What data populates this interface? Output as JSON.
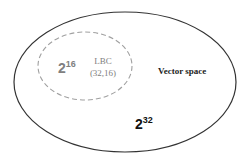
{
  "diagram": {
    "outer_set": {
      "label": "Vector space",
      "size_base": "2",
      "size_exp": "32",
      "stroke_color": "#333333"
    },
    "inner_set": {
      "label_line1": "LBC",
      "label_line2": "(32,16)",
      "size_base": "2",
      "size_exp": "16",
      "stroke_color": "#9a9a9a",
      "text_color": "#808080"
    }
  }
}
